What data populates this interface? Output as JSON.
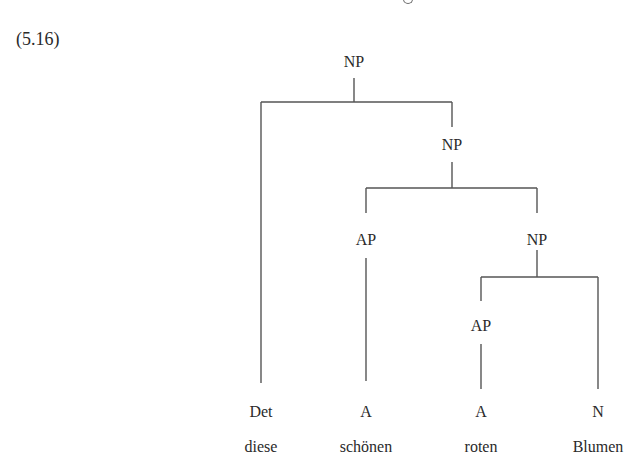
{
  "example_number": "(5.16)",
  "tree": {
    "nodes": [
      {
        "id": "np1",
        "label": "NP",
        "x": 354,
        "y": 62
      },
      {
        "id": "np2",
        "label": "NP",
        "x": 452,
        "y": 145
      },
      {
        "id": "ap1",
        "label": "AP",
        "x": 366,
        "y": 240
      },
      {
        "id": "np3",
        "label": "NP",
        "x": 537,
        "y": 240
      },
      {
        "id": "ap2",
        "label": "AP",
        "x": 481,
        "y": 326
      },
      {
        "id": "det",
        "label": "Det",
        "x": 261,
        "y": 412
      },
      {
        "id": "a1",
        "label": "A",
        "x": 366,
        "y": 412
      },
      {
        "id": "a2",
        "label": "A",
        "x": 481,
        "y": 412
      },
      {
        "id": "n",
        "label": "N",
        "x": 598,
        "y": 412
      }
    ],
    "words": [
      {
        "label": "diese",
        "x": 261,
        "y": 447
      },
      {
        "label": "schönen",
        "x": 366,
        "y": 447
      },
      {
        "label": "roten",
        "x": 481,
        "y": 447
      },
      {
        "label": "Blumen",
        "x": 598,
        "y": 447
      }
    ]
  }
}
